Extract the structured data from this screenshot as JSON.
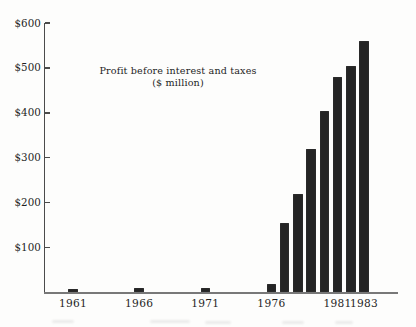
{
  "chart_data": {
    "type": "bar",
    "title": "Profit before interest and taxes",
    "subtitle": "($ million)",
    "xlabel": "",
    "ylabel": "",
    "ylim": [
      0,
      600
    ],
    "grid": false,
    "legend": "none",
    "bar_color": "#242424",
    "axis_color": "#4b4b4b",
    "y_ticks": [
      {
        "label": "$600",
        "value": 600
      },
      {
        "label": "$500",
        "value": 500
      },
      {
        "label": "$400",
        "value": 400
      },
      {
        "label": "$300",
        "value": 300
      },
      {
        "label": "$200",
        "value": 200
      },
      {
        "label": "$100",
        "value": 100
      }
    ],
    "x_tick_labels": [
      {
        "label": "1961",
        "year": 1961
      },
      {
        "label": "1966",
        "year": 1966
      },
      {
        "label": "1971",
        "year": 1971
      },
      {
        "label": "1976",
        "year": 1976
      },
      {
        "label": "1981",
        "year": 1981
      },
      {
        "label": "1983",
        "year": 1983
      }
    ],
    "series": [
      {
        "name": "Profit before interest and taxes ($ million)",
        "points": [
          {
            "year": 1961,
            "value": 8
          },
          {
            "year": 1966,
            "value": 10
          },
          {
            "year": 1971,
            "value": 10
          },
          {
            "year": 1976,
            "value": 20
          },
          {
            "year": 1977,
            "value": 155
          },
          {
            "year": 1978,
            "value": 220
          },
          {
            "year": 1979,
            "value": 320
          },
          {
            "year": 1980,
            "value": 405
          },
          {
            "year": 1981,
            "value": 480
          },
          {
            "year": 1982,
            "value": 505
          },
          {
            "year": 1983,
            "value": 560
          }
        ]
      }
    ]
  }
}
